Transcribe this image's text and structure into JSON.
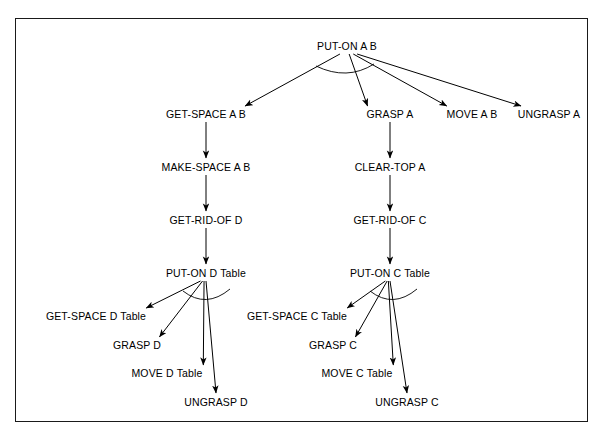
{
  "figure": {
    "type": "hierarchical-plan-decomposition-tree",
    "background_color": "#ffffff",
    "border_color": "#1a1a1a",
    "line_color": "#000000",
    "text_color": "#000000"
  },
  "nodes": [
    {
      "id": "put-on-a-b",
      "label": "PUT-ON A B",
      "x": 331,
      "y": 27,
      "level": 0
    },
    {
      "id": "get-space-a-b",
      "label": "GET-SPACE A B",
      "x": 190,
      "y": 95,
      "level": 1
    },
    {
      "id": "grasp-a",
      "label": "GRASP A",
      "x": 374,
      "y": 95,
      "level": 1
    },
    {
      "id": "move-a-b",
      "label": "MOVE A B",
      "x": 456,
      "y": 95,
      "level": 1
    },
    {
      "id": "ungrasp-a",
      "label": "UNGRASP A",
      "x": 533,
      "y": 95,
      "level": 1
    },
    {
      "id": "make-space-a-b",
      "label": "MAKE-SPACE A B",
      "x": 190,
      "y": 148,
      "level": 2
    },
    {
      "id": "clear-top-a",
      "label": "CLEAR-TOP A",
      "x": 374,
      "y": 148,
      "level": 2
    },
    {
      "id": "get-rid-of-d",
      "label": "GET-RID-OF D",
      "x": 190,
      "y": 201,
      "level": 3
    },
    {
      "id": "get-rid-of-c",
      "label": "GET-RID-OF C",
      "x": 374,
      "y": 201,
      "level": 3
    },
    {
      "id": "put-on-d-table",
      "label": "PUT-ON D Table",
      "x": 190,
      "y": 254,
      "level": 4
    },
    {
      "id": "put-on-c-table",
      "label": "PUT-ON C Table",
      "x": 374,
      "y": 254,
      "level": 4
    },
    {
      "id": "get-space-d-table",
      "label": "GET-SPACE D Table",
      "x": 80,
      "y": 297,
      "level": 5
    },
    {
      "id": "grasp-d",
      "label": "GRASP D",
      "x": 121,
      "y": 326,
      "level": 5
    },
    {
      "id": "move-d-table",
      "label": "MOVE D Table",
      "x": 151,
      "y": 354,
      "level": 5
    },
    {
      "id": "ungrasp-d",
      "label": "UNGRASP D",
      "x": 200,
      "y": 383,
      "level": 5
    },
    {
      "id": "get-space-c-table",
      "label": "GET-SPACE C Table",
      "x": 281,
      "y": 297,
      "level": 5
    },
    {
      "id": "grasp-c",
      "label": "GRASP C",
      "x": 317,
      "y": 326,
      "level": 5
    },
    {
      "id": "move-c-table",
      "label": "MOVE C Table",
      "x": 341,
      "y": 354,
      "level": 5
    },
    {
      "id": "ungrasp-c",
      "label": "UNGRASP C",
      "x": 391,
      "y": 383,
      "level": 5
    }
  ],
  "edges": [
    {
      "from": "put-on-a-b",
      "to": "get-space-a-b",
      "style": "arrow"
    },
    {
      "from": "put-on-a-b",
      "to": "grasp-a",
      "style": "arrow"
    },
    {
      "from": "put-on-a-b",
      "to": "move-a-b",
      "style": "arrow"
    },
    {
      "from": "put-on-a-b",
      "to": "ungrasp-a",
      "style": "arrow"
    },
    {
      "from": "get-space-a-b",
      "to": "make-space-a-b",
      "style": "arrow"
    },
    {
      "from": "make-space-a-b",
      "to": "get-rid-of-d",
      "style": "arrow"
    },
    {
      "from": "get-rid-of-d",
      "to": "put-on-d-table",
      "style": "arrow"
    },
    {
      "from": "grasp-a",
      "to": "clear-top-a",
      "style": "arrow"
    },
    {
      "from": "clear-top-a",
      "to": "get-rid-of-c",
      "style": "arrow"
    },
    {
      "from": "get-rid-of-c",
      "to": "put-on-c-table",
      "style": "arrow"
    },
    {
      "from": "put-on-d-table",
      "to": "get-space-d-table",
      "style": "arrow"
    },
    {
      "from": "put-on-d-table",
      "to": "grasp-d",
      "style": "arrow"
    },
    {
      "from": "put-on-d-table",
      "to": "move-d-table",
      "style": "arrow"
    },
    {
      "from": "put-on-d-table",
      "to": "ungrasp-d",
      "style": "arrow"
    },
    {
      "from": "put-on-c-table",
      "to": "get-space-c-table",
      "style": "arrow"
    },
    {
      "from": "put-on-c-table",
      "to": "grasp-c",
      "style": "arrow"
    },
    {
      "from": "put-on-c-table",
      "to": "move-c-table",
      "style": "arrow"
    },
    {
      "from": "put-on-c-table",
      "to": "ungrasp-c",
      "style": "arrow"
    }
  ],
  "and_connector_arcs": [
    {
      "at_node": "put-on-a-b",
      "description": "arc joining the four child branches"
    },
    {
      "at_node": "put-on-d-table",
      "description": "arc joining the four child branches"
    },
    {
      "at_node": "put-on-c-table",
      "description": "arc joining the four child branches"
    }
  ]
}
